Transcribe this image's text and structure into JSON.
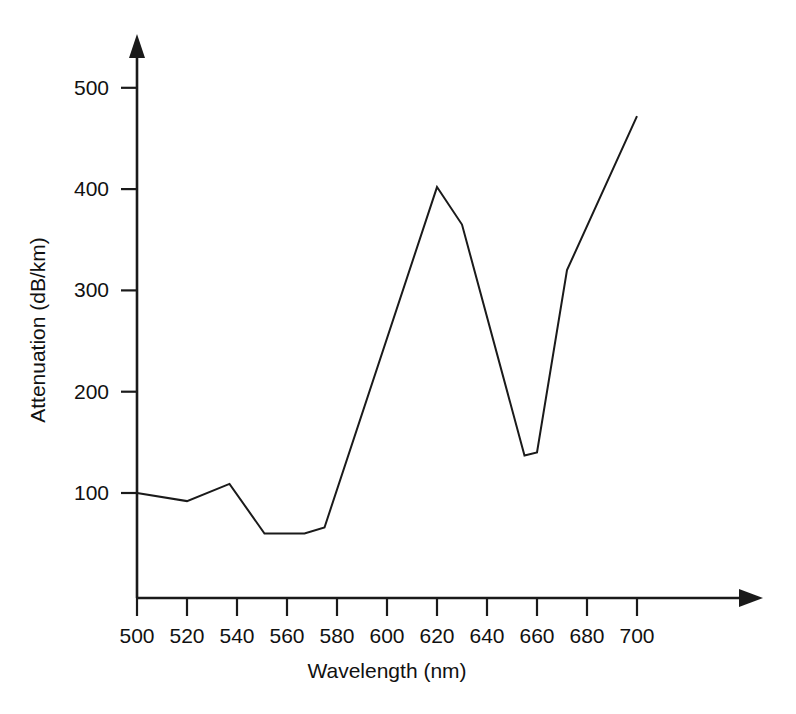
{
  "chart_data": {
    "type": "line",
    "title": "",
    "xlabel": "Wavelength (nm)",
    "ylabel": "Attenuation (dB/km)",
    "xlim": [
      490,
      710
    ],
    "ylim": [
      0,
      540
    ],
    "grid": false,
    "legend": null,
    "x_ticks": [
      500,
      520,
      540,
      560,
      580,
      600,
      620,
      640,
      660,
      680,
      700
    ],
    "y_ticks": [
      100,
      200,
      300,
      400,
      500
    ],
    "x_tick_labels": [
      "500",
      "520",
      "540",
      "560",
      "580",
      "600",
      "620",
      "640",
      "660",
      "680",
      "700"
    ],
    "y_tick_labels": [
      "100",
      "200",
      "300",
      "400",
      "500"
    ],
    "line_color": "#1a1a1a",
    "x": [
      500,
      520,
      537,
      551,
      567,
      575,
      620,
      630,
      655,
      660,
      672,
      700
    ],
    "y": [
      100,
      92,
      109,
      60,
      60,
      66,
      402,
      365,
      137,
      140,
      320,
      472
    ],
    "series": [
      {
        "name": "Attenuation",
        "x": [
          500,
          520,
          537,
          551,
          567,
          575,
          620,
          630,
          655,
          660,
          672,
          700
        ],
        "values": [
          100,
          92,
          109,
          60,
          60,
          66,
          402,
          365,
          137,
          140,
          320,
          472
        ]
      }
    ],
    "annotations": []
  },
  "axes": {
    "x_arrow": "right-arrow-icon",
    "y_arrow": "up-arrow-icon"
  }
}
